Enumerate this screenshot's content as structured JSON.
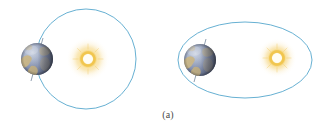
{
  "figure": {
    "caption": "(a)",
    "background_color": "#ffffff",
    "panels": [
      {
        "id": "left-panel",
        "label": "circular-orbit-diagram",
        "orbit": {
          "shape": "circle",
          "center_x": 86,
          "center_y": 59,
          "radius_x": 50,
          "radius_y": 50,
          "stroke_color": "#5aa9ce",
          "stroke_width": 1
        },
        "sun": {
          "name": "sun",
          "center_x": 88,
          "center_y": 59,
          "core_radius": 6,
          "ring_radius": 9,
          "glow_radius": 22,
          "core_color": "#fffdf2",
          "ring_color": "#f2c24a",
          "glow_color": "#f6cf6a"
        },
        "earth": {
          "name": "earth",
          "center_x": 37,
          "center_y": 59,
          "radius": 16,
          "ocean_color": "#7d8bab",
          "ocean_light_color": "#b9c2d6",
          "land_color": "#cbb683",
          "shadow_color": "#3b3f51"
        },
        "axis": {
          "name": "earth-rotation-axis",
          "visible": true,
          "color": "#6d7f96"
        }
      },
      {
        "id": "right-panel",
        "label": "elliptical-orbit-diagram",
        "orbit": {
          "shape": "ellipse",
          "center_x": 245,
          "center_y": 60,
          "radius_x": 67,
          "radius_y": 38,
          "stroke_color": "#5aa9ce",
          "stroke_width": 1
        },
        "sun": {
          "name": "sun",
          "center_x": 277,
          "center_y": 58,
          "core_radius": 6,
          "ring_radius": 9,
          "glow_radius": 20,
          "core_color": "#fffdf2",
          "ring_color": "#f2c24a",
          "glow_color": "#f6cf6a"
        },
        "earth": {
          "name": "earth",
          "center_x": 200,
          "center_y": 60,
          "radius": 16,
          "ocean_color": "#7d8bab",
          "ocean_light_color": "#b9c2d6",
          "land_color": "#cbb683",
          "shadow_color": "#3b3f51"
        },
        "axis": {
          "name": "earth-rotation-axis",
          "visible": true,
          "color": "#6d7f96"
        }
      }
    ]
  }
}
